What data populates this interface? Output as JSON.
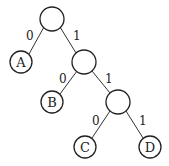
{
  "diagram": {
    "type": "binary-tree",
    "nodes": [
      {
        "id": "root",
        "label": "",
        "cx": 52,
        "cy": 19
      },
      {
        "id": "A",
        "label": "A",
        "cx": 21,
        "cy": 62
      },
      {
        "id": "n1",
        "label": "",
        "cx": 84,
        "cy": 62
      },
      {
        "id": "B",
        "label": "B",
        "cx": 52,
        "cy": 102
      },
      {
        "id": "n2",
        "label": "",
        "cx": 118,
        "cy": 102
      },
      {
        "id": "C",
        "label": "C",
        "cx": 85,
        "cy": 147
      },
      {
        "id": "D",
        "label": "D",
        "cx": 150,
        "cy": 147
      }
    ],
    "edges": [
      {
        "from": "root",
        "to": "A",
        "label": "0"
      },
      {
        "from": "root",
        "to": "n1",
        "label": "1"
      },
      {
        "from": "n1",
        "to": "B",
        "label": "0"
      },
      {
        "from": "n1",
        "to": "n2",
        "label": "1"
      },
      {
        "from": "n2",
        "to": "C",
        "label": "0"
      },
      {
        "from": "n2",
        "to": "D",
        "label": "1"
      }
    ]
  }
}
